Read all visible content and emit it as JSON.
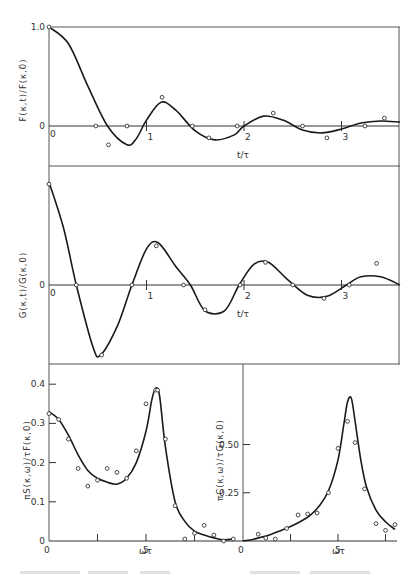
{
  "chart_data": [
    {
      "id": "F",
      "type": "line",
      "ylabel": "F(κ,t)/F(κ,0)",
      "xlabel": "t/τ",
      "x_ticks": [
        "0",
        "1",
        "2",
        "3"
      ],
      "y_ticks": [
        "1.0",
        "0"
      ],
      "xlim": [
        0,
        3.6
      ],
      "ylim": [
        -0.35,
        1.0
      ],
      "curve": {
        "x": [
          0,
          0.2,
          0.4,
          0.6,
          0.8,
          0.9,
          1.0,
          1.15,
          1.3,
          1.5,
          1.7,
          1.9,
          2.0,
          2.2,
          2.4,
          2.6,
          2.8,
          3.0,
          3.2,
          3.4,
          3.6
        ],
        "y": [
          1.0,
          0.83,
          0.4,
          0.0,
          -0.19,
          -0.12,
          0.06,
          0.24,
          0.16,
          -0.05,
          -0.14,
          -0.09,
          0.0,
          0.1,
          0.06,
          -0.04,
          -0.07,
          -0.03,
          0.03,
          0.05,
          0.04
        ]
      },
      "points": {
        "x": [
          0,
          0.48,
          0.61,
          0.8,
          1.16,
          1.47,
          1.64,
          1.93,
          2.3,
          2.6,
          2.85,
          3.24,
          3.44
        ],
        "y": [
          1.0,
          0.0,
          -0.19,
          0.0,
          0.29,
          0.0,
          -0.12,
          0.0,
          0.13,
          0.0,
          -0.12,
          0.0,
          0.08
        ]
      }
    },
    {
      "id": "G",
      "type": "line",
      "ylabel": "G(κ,t)/G(κ,0)",
      "xlabel": "t/τ",
      "x_ticks": [
        "0",
        "1",
        "2",
        "3"
      ],
      "y_ticks": [
        "0"
      ],
      "xlim": [
        0,
        3.6
      ],
      "ylim": [
        -1.0,
        1.0
      ],
      "curve": {
        "x": [
          0,
          0.15,
          0.28,
          0.45,
          0.53,
          0.7,
          0.85,
          1.0,
          1.12,
          1.3,
          1.45,
          1.6,
          1.8,
          1.95,
          2.1,
          2.25,
          2.45,
          2.65,
          2.85,
          3.05,
          3.2,
          3.4,
          3.6
        ],
        "y": [
          1.0,
          0.55,
          0.0,
          -0.6,
          -0.68,
          -0.4,
          0.0,
          0.35,
          0.41,
          0.18,
          0.0,
          -0.25,
          -0.25,
          0.0,
          0.2,
          0.22,
          0.05,
          -0.1,
          -0.11,
          0.0,
          0.08,
          0.08,
          0.0
        ]
      },
      "points": {
        "x": [
          0,
          0.28,
          0.54,
          0.85,
          1.1,
          1.38,
          1.6,
          1.96,
          2.22,
          2.5,
          2.82,
          3.08,
          3.36
        ],
        "y": [
          0.98,
          0.0,
          -0.68,
          0.0,
          0.38,
          0.0,
          -0.24,
          0.0,
          0.22,
          0.0,
          -0.13,
          0.0,
          0.21
        ]
      }
    },
    {
      "id": "S",
      "type": "line",
      "ylabel": "πS(κ,ω)/τF(κ,0)",
      "xlabel": "ωτ",
      "x_ticks": [
        "0",
        "5"
      ],
      "y_ticks": [
        "0",
        "0.1",
        "0.2",
        "0.3",
        "0.4"
      ],
      "xlim": [
        0,
        10
      ],
      "ylim": [
        0,
        0.45
      ],
      "curve": {
        "x": [
          0,
          0.5,
          1,
          1.5,
          2,
          2.5,
          3,
          3.5,
          4,
          4.5,
          5,
          5.3,
          5.5,
          5.7,
          6,
          6.5,
          7,
          7.5,
          8,
          8.5,
          9,
          9.5
        ],
        "y": [
          0.33,
          0.31,
          0.27,
          0.22,
          0.18,
          0.16,
          0.15,
          0.145,
          0.16,
          0.2,
          0.28,
          0.36,
          0.39,
          0.37,
          0.24,
          0.1,
          0.05,
          0.025,
          0.015,
          0.008,
          0.003,
          0.005
        ]
      },
      "points": {
        "x": [
          0,
          0.5,
          1,
          1.5,
          2,
          2.5,
          3,
          3.5,
          4,
          4.5,
          5,
          5.5,
          5.6,
          6,
          6.5,
          7,
          7.5,
          8,
          8.5,
          9,
          9.5
        ],
        "y": [
          0.325,
          0.31,
          0.26,
          0.185,
          0.14,
          0.155,
          0.185,
          0.175,
          0.16,
          0.23,
          0.35,
          0.385,
          0.385,
          0.26,
          0.09,
          0.005,
          0.02,
          0.04,
          0.015,
          0.0,
          0.005
        ]
      }
    },
    {
      "id": "C",
      "type": "line",
      "ylabel": "πC(κ,ω)/τG(κ,0)",
      "xlabel": "ωτ",
      "x_ticks": [
        "0",
        "5"
      ],
      "y_ticks": [
        "0.25",
        "0.50"
      ],
      "xlim": [
        0,
        8
      ],
      "ylim": [
        0,
        0.9
      ],
      "curve": {
        "x": [
          0,
          0.5,
          1,
          1.5,
          2,
          2.5,
          3,
          3.5,
          4,
          4.5,
          5,
          5.3,
          5.5,
          5.7,
          5.9,
          6.2,
          6.5,
          7,
          7.5,
          8
        ],
        "y": [
          0.0,
          0.008,
          0.02,
          0.035,
          0.055,
          0.075,
          0.1,
          0.13,
          0.18,
          0.26,
          0.42,
          0.6,
          0.72,
          0.74,
          0.62,
          0.42,
          0.28,
          0.16,
          0.1,
          0.06
        ]
      },
      "points": {
        "x": [
          0.8,
          1.2,
          1.7,
          2.3,
          2.9,
          3.4,
          3.9,
          4.5,
          5.0,
          5.5,
          5.9,
          6.4,
          7.0,
          7.5,
          8.0
        ],
        "y": [
          0.035,
          0.015,
          0.01,
          0.065,
          0.135,
          0.14,
          0.145,
          0.25,
          0.48,
          0.62,
          0.51,
          0.27,
          0.09,
          0.055,
          0.085
        ]
      }
    }
  ]
}
